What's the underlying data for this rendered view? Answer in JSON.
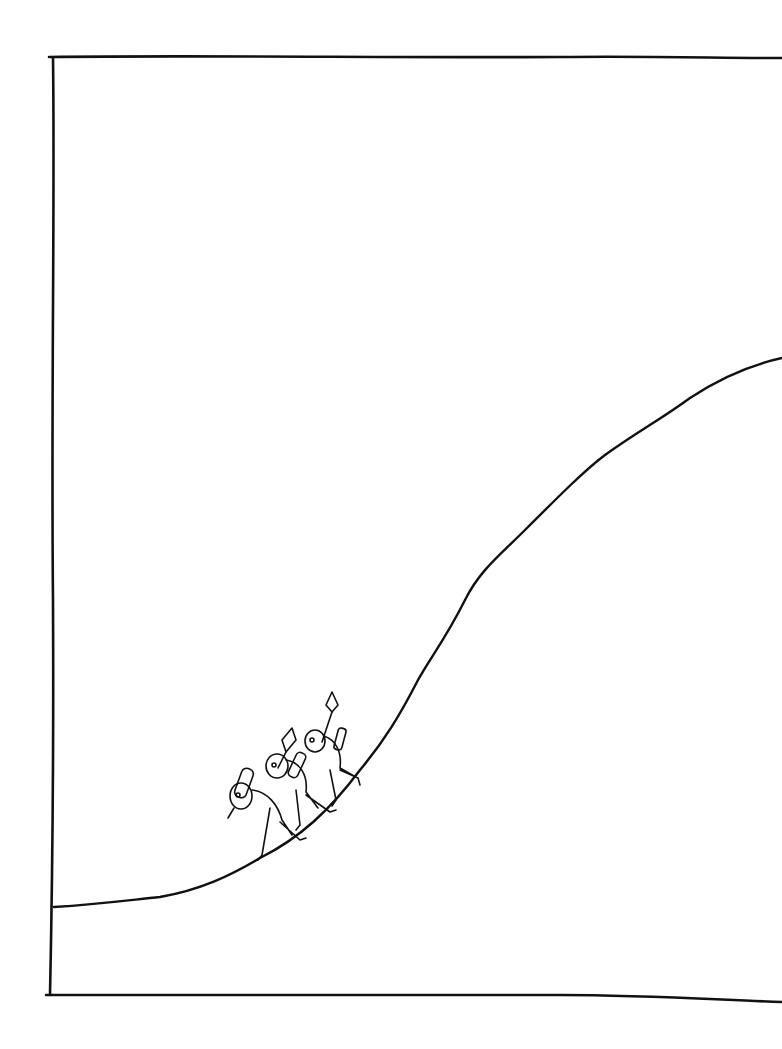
{
  "illustration": {
    "background": "#ffffff",
    "ink_color": "#111111",
    "elements": [
      {
        "name": "frame",
        "description": "hand-drawn rectangular frame open on the right edge"
      },
      {
        "name": "hill-curve",
        "description": "S-shaped rising curve from lower-left to upper-right"
      },
      {
        "name": "climbing-figures",
        "count": 3,
        "description": "three small cartoon figures walking up the slope carrying tools"
      }
    ]
  }
}
